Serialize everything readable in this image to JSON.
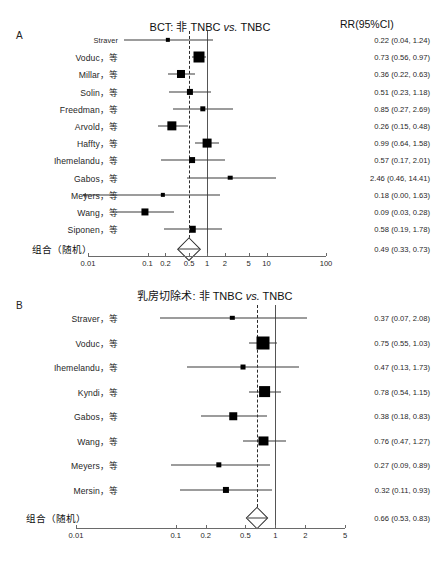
{
  "figure": {
    "caption": "",
    "value_header": "RR(95%CI)"
  },
  "chart_data": [
    {
      "type": "forest",
      "panel": "A",
      "title_prefix": "BCT: 非 TNBC ",
      "title_italic": "vs.",
      "title_suffix": " TNBC",
      "title": "BCT: 非 TNBC vs. TNBC",
      "value_header": "RR(95%CI)",
      "xlabel": "",
      "effect_measure": "RR",
      "xscale": "log",
      "xlim": [
        0.01,
        100
      ],
      "ticks": [
        0.01,
        0.1,
        0.2,
        0.5,
        1,
        2,
        5,
        10,
        100
      ],
      "tick_labels": [
        "0.01",
        "0.1",
        "0.2",
        "0.5",
        "1",
        "2",
        "5",
        "10",
        "100"
      ],
      "null_line": 1,
      "pooled_line": 0.49,
      "rows": [
        {
          "study": "Straver",
          "cjk": false,
          "est": 0.22,
          "lo": 0.04,
          "hi": 1.24,
          "text": "0.22 (0.04, 1.24)",
          "weight": 0.14,
          "clip_low": false
        },
        {
          "study": "Voduc，等",
          "cjk": true,
          "est": 0.73,
          "lo": 0.56,
          "hi": 0.97,
          "text": "0.73 (0.56, 0.97)",
          "weight": 1.0,
          "clip_low": false
        },
        {
          "study": "Millar，等",
          "cjk": true,
          "est": 0.36,
          "lo": 0.22,
          "hi": 0.63,
          "text": "0.36 (0.22, 0.63)",
          "weight": 0.62,
          "clip_low": false
        },
        {
          "study": "Solin，等",
          "cjk": true,
          "est": 0.51,
          "lo": 0.23,
          "hi": 1.18,
          "text": "0.51 (0.23, 1.18)",
          "weight": 0.38,
          "clip_low": false
        },
        {
          "study": "Freedman，等",
          "cjk": true,
          "est": 0.85,
          "lo": 0.27,
          "hi": 2.69,
          "text": "0.85 (0.27, 2.69)",
          "weight": 0.28,
          "clip_low": false
        },
        {
          "study": "Arvold，等",
          "cjk": true,
          "est": 0.26,
          "lo": 0.15,
          "hi": 0.48,
          "text": "0.26 (0.15, 0.48)",
          "weight": 0.78,
          "clip_low": false
        },
        {
          "study": "Haffty，等",
          "cjk": true,
          "est": 0.99,
          "lo": 0.64,
          "hi": 1.58,
          "text": "0.99 (0.64, 1.58)",
          "weight": 0.72,
          "clip_low": false
        },
        {
          "study": "Ihemelandu，等",
          "cjk": true,
          "est": 0.57,
          "lo": 0.17,
          "hi": 2.01,
          "text": "0.57 (0.17, 2.01)",
          "weight": 0.34,
          "clip_low": false
        },
        {
          "study": "Gabos，等",
          "cjk": true,
          "est": 2.46,
          "lo": 0.46,
          "hi": 14.41,
          "text": "2.46 (0.46, 14.41)",
          "weight": 0.18,
          "clip_low": false
        },
        {
          "study": "Meyers，等",
          "cjk": true,
          "est": 0.18,
          "lo": 0.004,
          "hi": 1.63,
          "text": "0.18 (0.00, 1.63)",
          "weight": 0.14,
          "clip_low": true
        },
        {
          "study": "Wang，等",
          "cjk": true,
          "est": 0.09,
          "lo": 0.03,
          "hi": 0.28,
          "text": "0.09 (0.03, 0.28)",
          "weight": 0.5,
          "clip_low": false
        },
        {
          "study": "Siponen，等",
          "cjk": true,
          "est": 0.58,
          "lo": 0.19,
          "hi": 1.78,
          "text": "0.58 (0.19, 1.78)",
          "weight": 0.42,
          "clip_low": false
        }
      ],
      "summary": {
        "label": "组合（随机）",
        "est": 0.49,
        "lo": 0.33,
        "hi": 0.73,
        "text": "0.49 (0.33, 0.73)"
      }
    },
    {
      "type": "forest",
      "panel": "B",
      "title_prefix": "乳房切除术: 非 TNBC ",
      "title_italic": "vs.",
      "title_suffix": " TNBC",
      "title": "乳房切除术: 非 TNBC vs. TNBC",
      "value_header": "",
      "xlabel": "",
      "effect_measure": "RR",
      "xscale": "log",
      "xlim": [
        0.01,
        5
      ],
      "ticks": [
        0.01,
        0.1,
        0.2,
        0.5,
        1,
        2,
        5
      ],
      "tick_labels": [
        "0.01",
        "0.1",
        "0.2",
        "0.5",
        "1",
        "2",
        "5"
      ],
      "null_line": 1,
      "pooled_line": 0.66,
      "rows": [
        {
          "study": "Straver，等",
          "cjk": true,
          "est": 0.37,
          "lo": 0.07,
          "hi": 2.08,
          "text": "0.37 (0.07, 2.08)",
          "weight": 0.12,
          "clip_low": false
        },
        {
          "study": "Voduc，等",
          "cjk": true,
          "est": 0.75,
          "lo": 0.55,
          "hi": 1.03,
          "text": "0.75 (0.55, 1.03)",
          "weight": 1.0,
          "clip_low": false
        },
        {
          "study": "Ihemelandu，等",
          "cjk": true,
          "est": 0.47,
          "lo": 0.13,
          "hi": 1.73,
          "text": "0.47 (0.13, 1.73)",
          "weight": 0.18,
          "clip_low": false
        },
        {
          "study": "Kyndi，等",
          "cjk": true,
          "est": 0.78,
          "lo": 0.54,
          "hi": 1.15,
          "text": "0.78 (0.54, 1.15)",
          "weight": 0.88,
          "clip_low": false
        },
        {
          "study": "Gabos，等",
          "cjk": true,
          "est": 0.38,
          "lo": 0.18,
          "hi": 0.83,
          "text": "0.38 (0.18, 0.83)",
          "weight": 0.44,
          "clip_low": false
        },
        {
          "study": "Wang，等",
          "cjk": true,
          "est": 0.76,
          "lo": 0.47,
          "hi": 1.27,
          "text": "0.76 (0.47, 1.27)",
          "weight": 0.6,
          "clip_low": false
        },
        {
          "study": "Meyers，等",
          "cjk": true,
          "est": 0.27,
          "lo": 0.09,
          "hi": 0.89,
          "text": "0.27 (0.09, 0.89)",
          "weight": 0.22,
          "clip_low": false
        },
        {
          "study": "Mersin，等",
          "cjk": true,
          "est": 0.32,
          "lo": 0.11,
          "hi": 0.93,
          "text": "0.32 (0.11, 0.93)",
          "weight": 0.3,
          "clip_low": false
        }
      ],
      "summary": {
        "label": "组合（随机）",
        "est": 0.66,
        "lo": 0.53,
        "hi": 0.83,
        "text": "0.66 (0.53, 0.83)"
      }
    }
  ]
}
